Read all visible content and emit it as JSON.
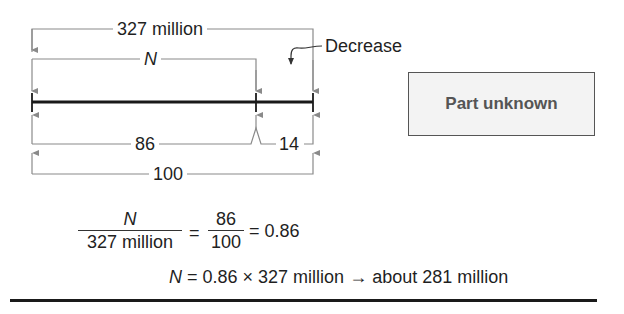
{
  "diagram": {
    "total_label": "327 million",
    "part_label": "N",
    "decrease_label": "Decrease",
    "percent_part_label": "86",
    "percent_decrease_label": "14",
    "percent_total_label": "100",
    "box_label": "Part unknown"
  },
  "equations": {
    "line1": {
      "frac1_num": "N",
      "frac1_den": "327 million",
      "eq1": "=",
      "frac2_num": "86",
      "frac2_den": "100",
      "result": "= 0.86"
    },
    "line2": {
      "var": "N",
      "expr": "= 0.86 × 327 million",
      "arrow": "→",
      "result": "about 281 million"
    }
  },
  "colors": {
    "axis": "#1a1a1a",
    "bracket": "#8a8a8a",
    "box_fill": "#f3f3f3",
    "box_text": "#555555"
  }
}
